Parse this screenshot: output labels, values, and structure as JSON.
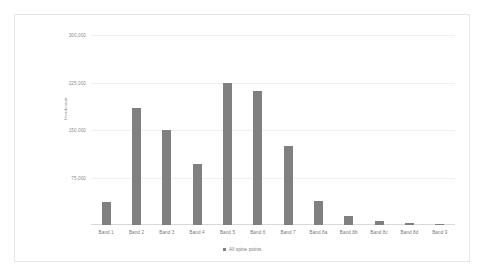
{
  "chart_data": {
    "type": "bar",
    "title": "",
    "xlabel": "",
    "ylabel": "Headcount",
    "ylim": [
      0,
      300000
    ],
    "grid": true,
    "legend_position": "bottom",
    "yticks": [
      "75,000",
      "150,000",
      "225,000",
      "300,000"
    ],
    "ytick_values": [
      75000,
      150000,
      225000,
      300000
    ],
    "categories": [
      "Band 1",
      "Band 2",
      "Band 3",
      "Band 4",
      "Band 5",
      "Band 6",
      "Band 7",
      "Band 8a",
      "Band 8b",
      "Band 8c",
      "Band 8d",
      "Band 9"
    ],
    "series": [
      {
        "name": "All spine points",
        "color": "#808080",
        "values": [
          36000,
          185000,
          150000,
          97000,
          225000,
          211000,
          124000,
          38000,
          14000,
          6000,
          3000,
          1000
        ]
      }
    ]
  },
  "legend": {
    "items": [
      {
        "label": "All spine points"
      }
    ]
  }
}
